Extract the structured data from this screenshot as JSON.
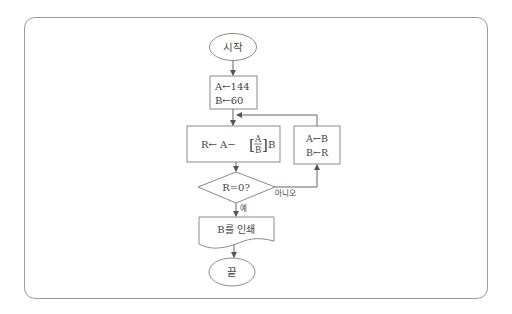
{
  "diagram": {
    "type": "flowchart",
    "nodes": {
      "start": {
        "shape": "terminator",
        "label": "시작"
      },
      "init": {
        "shape": "process",
        "lines": [
          "A←144",
          "B←60"
        ]
      },
      "compute": {
        "shape": "process",
        "prefix": "R← A−",
        "frac_num": "A",
        "frac_den": "B",
        "suffix": "B"
      },
      "swap": {
        "shape": "process",
        "lines": [
          "A←B",
          "B←R"
        ]
      },
      "decision": {
        "shape": "decision",
        "label": "R=0?"
      },
      "output": {
        "shape": "document",
        "label": "B를 인쇄"
      },
      "end": {
        "shape": "terminator",
        "label": "끝"
      }
    },
    "edges": {
      "yes_label": "예",
      "no_label": "아니오"
    },
    "colors": {
      "stroke": "#8a8a8a",
      "text": "#444444",
      "frame": "#9a9a9a"
    }
  }
}
